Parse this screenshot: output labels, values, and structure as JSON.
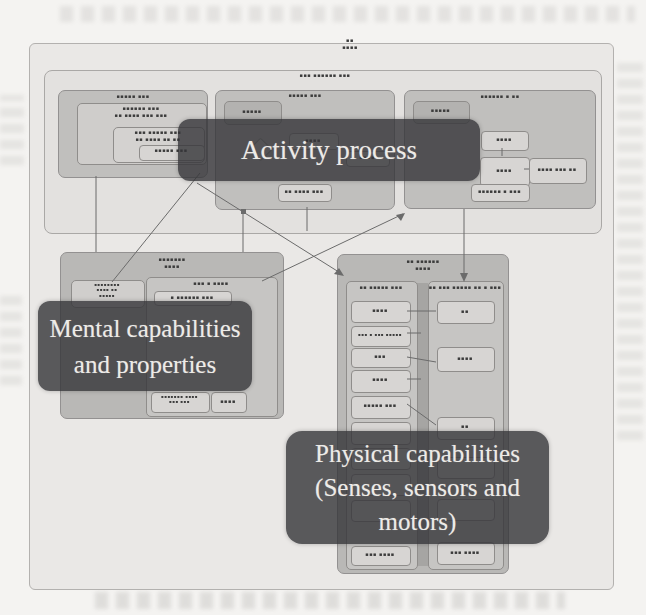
{
  "callouts": {
    "activity": {
      "label": "Activity process"
    },
    "mental": {
      "line1": "Mental capabilities",
      "line2": "and properties"
    },
    "physical": {
      "line1": "Physical capabilities",
      "line2": "(Senses, sensors and",
      "line3": "motors)"
    }
  },
  "fig": {
    "tag_line1": "▪▪",
    "tag_line2": "▪▪▪▪",
    "inner_tag": "▪▪▪ ▪▪▪▪▪▪ ▪▪▪"
  },
  "groups": {
    "top_left": {
      "title": "▪▪▪▪▪ ▪▪▪",
      "inner_title_l1": "▪▪▪▪▪▪ ▪▪▪",
      "inner_title_l2": "▪▪ ▪▪▪▪ ▪▪▪ ▪▪▪",
      "sub_l1": "▪▪▪ ▪▪▪▪▪ ▪▪▪",
      "sub_l2": "▪▪ ▪▪▪▪ ▪▪ ▪▪",
      "leaf": "▪▪▪▪▪ ▪▪▪"
    },
    "top_middle": {
      "title": "▪▪▪▪▪ ▪▪▪",
      "corner": "▪▪▪▪▪",
      "hidden1": "▪▪▪▪",
      "hidden2": "▪▪▪▪",
      "bottom": "▪▪ ▪▪▪▪ ▪▪▪"
    },
    "top_right": {
      "title": "▪▪▪▪▪▪ ▪ ▪▪",
      "corner": "▪▪▪▪▪",
      "c1": "▪▪▪▪",
      "c2": "▪▪▪▪",
      "c3": "▪▪▪▪ ▪▪▪ ▪▪",
      "c4": "▪▪▪▪▪▪ ▪ ▪▪▪"
    },
    "mental": {
      "title_l1": "▪▪▪▪▪▪▪",
      "title_l2": "▪▪▪▪",
      "corner_l1": "▪▪▪▪▪▪▪▪",
      "corner_l2": "▪▪▪▪ ▪▪",
      "corner_l3": "▪▪▪▪▪",
      "inner_title": "▪▪▪ ▪ ▪▪▪▪",
      "i1": "▪ ▪▪▪▪▪▪ ▪▪▪",
      "b1_l1": "▪▪▪▪▪▪▪ ▪▪▪▪",
      "b1_l2": "▪▪▪ ▪▪▪",
      "b2": "▪▪▪▪"
    },
    "physical": {
      "title_l1": "▪▪ ▪▪▪▪▪▪",
      "title_l2": "▪▪▪▪",
      "left_title": "▪▪ ▪▪▪▪▪ ▪▪▪",
      "right_title": "▪▪ ▪▪▪ ▪▪▪▪▪ ▪▪ ▪ ▪▪▪",
      "l1": "▪▪▪▪",
      "l2": "▪▪▪ ▪ ▪▪▪ ▪▪▪▪▪",
      "l3": "▪▪▪",
      "l4": "▪▪▪▪",
      "l5": "▪▪▪▪▪ ▪▪▪",
      "l_last": "▪▪▪ ▪▪▪▪",
      "r1": "▪▪",
      "r2": "▪▪▪▪",
      "r3": "▪▪",
      "r_last": "▪▪▪ ▪▪▪▪"
    }
  }
}
